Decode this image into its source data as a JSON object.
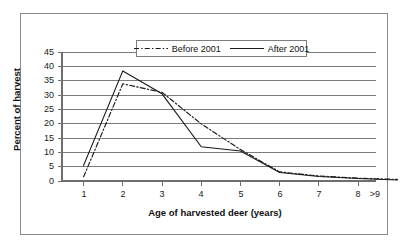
{
  "chart_data": {
    "type": "line",
    "title": "",
    "xlabel": "Age of harvested deer (years)",
    "ylabel": "Percent of harvest",
    "categories": [
      "1",
      "2",
      "3",
      "4",
      "5",
      "6",
      "7",
      "8",
      ">9"
    ],
    "x_tick_labels": [
      "1",
      "2",
      "3",
      "4",
      "5",
      "6",
      "7",
      "8",
      ">9"
    ],
    "y_tick_labels": [
      "0",
      "5",
      "10",
      "15",
      "20",
      "25",
      "30",
      "35",
      "40",
      "45"
    ],
    "y_ticks": [
      0,
      5,
      10,
      15,
      20,
      25,
      30,
      35,
      40,
      45
    ],
    "ylim": [
      0,
      45
    ],
    "grid": "horizontal",
    "legend_position": "top-center",
    "series": [
      {
        "name": "Before 2001",
        "style": "dash-dot",
        "color": "#1a1a1a",
        "values": [
          1.5,
          34.0,
          31.0,
          20.0,
          11.0,
          3.2,
          1.8,
          1.0,
          0.6
        ]
      },
      {
        "name": "After 2001",
        "style": "solid",
        "color": "#1a1a1a",
        "values": [
          5.5,
          38.5,
          30.5,
          12.0,
          10.5,
          3.0,
          1.6,
          0.9,
          0.4
        ]
      }
    ]
  },
  "legend": {
    "entries": [
      {
        "label": "Before 2001",
        "swatch": "dash-dot-line-icon"
      },
      {
        "label": "After 2001",
        "swatch": "solid-line-icon"
      }
    ]
  },
  "axes": {
    "x_title": "Age of harvested deer (years)",
    "y_title": "Percent of harvest"
  },
  "colors": {
    "line": "#1a1a1a",
    "grid": "#7a7a7a",
    "axis": "#6e6e6e",
    "frame": "#8a8a8a",
    "background": "#ffffff"
  }
}
